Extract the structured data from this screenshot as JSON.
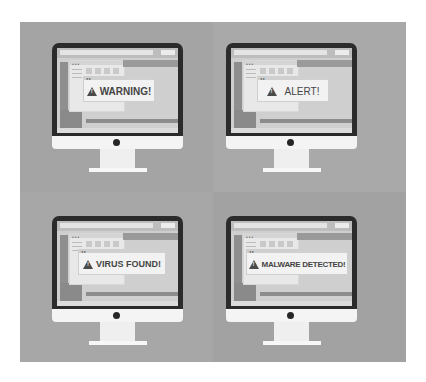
{
  "panels": [
    {
      "id": "warning",
      "message": "WARNING!"
    },
    {
      "id": "alert",
      "message": "ALERT!"
    },
    {
      "id": "virus",
      "message": "VIRUS FOUND!"
    },
    {
      "id": "malware",
      "message": "MALWARE DETECTED!"
    }
  ],
  "icons": {
    "alert": "warning-triangle-icon",
    "camera": "camera-dot"
  },
  "colors": {
    "panel_background": "#a6a6a6",
    "bezel": "#2b2b2b",
    "chin": "#f4f4f4",
    "dialog_text": "#454545"
  }
}
